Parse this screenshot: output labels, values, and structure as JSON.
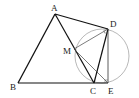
{
  "figure": {
    "type": "geometry-diagram",
    "points": {
      "A": {
        "label": "A",
        "x": 55,
        "y": 14
      },
      "B": {
        "label": "B",
        "x": 18,
        "y": 83
      },
      "C": {
        "label": "C",
        "x": 94,
        "y": 83
      },
      "D": {
        "label": "D",
        "x": 108,
        "y": 29
      },
      "E": {
        "label": "E",
        "x": 108,
        "y": 83
      },
      "M": {
        "label": "M",
        "x": 74,
        "y": 49
      }
    },
    "segments": [
      "AB",
      "BC",
      "CE",
      "AD",
      "AC",
      "CD",
      "DE",
      "MD",
      "ME"
    ],
    "circle": {
      "cx": 102,
      "cy": 56,
      "r": 27
    },
    "right_angle_marks": [
      "D",
      "E"
    ]
  }
}
